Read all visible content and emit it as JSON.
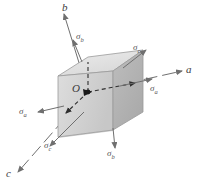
{
  "figure": {
    "type": "engineering-diagram",
    "background": "#ffffff"
  },
  "origin": {
    "label": "O"
  },
  "axes": [
    {
      "name": "a",
      "label": "a",
      "direction": "right",
      "x1": 88,
      "y1": 92,
      "x2": 186,
      "y2": 70,
      "style": "dashed"
    },
    {
      "name": "b",
      "label": "b",
      "direction": "up",
      "x1": 88,
      "y1": 92,
      "x2": 62,
      "y2": 8,
      "style": "dashed"
    },
    {
      "name": "c",
      "label": "c",
      "direction": "lower-left",
      "x1": 88,
      "y1": 92,
      "x2": 14,
      "y2": 176,
      "style": "dashed"
    }
  ],
  "stress_arrows": [
    {
      "name": "sigma-a-right",
      "symbol": "σ",
      "subscript": "a",
      "x": 155,
      "y": 88,
      "heading": "right"
    },
    {
      "name": "sigma-a-left",
      "symbol": "σ",
      "subscript": "a",
      "x": 24,
      "y": 110,
      "heading": "left"
    },
    {
      "name": "sigma-b-up",
      "symbol": "σ",
      "subscript": "b",
      "x": 80,
      "y": 36,
      "heading": "up"
    },
    {
      "name": "sigma-b-down",
      "symbol": "σ",
      "subscript": "b",
      "x": 110,
      "y": 150,
      "heading": "down"
    },
    {
      "name": "sigma-c-upper-right",
      "symbol": "σ",
      "subscript": "c",
      "x": 137,
      "y": 47,
      "heading": "upper-right"
    },
    {
      "name": "sigma-c-lower-left",
      "symbol": "σ",
      "subscript": "c",
      "x": 48,
      "y": 143,
      "heading": "lower-left"
    }
  ],
  "cube": {
    "name": "stress-element-cube",
    "face_top_fill": "#e3e3e3",
    "face_left_fill": "#d3d3d3",
    "face_front_fill": "#b6b6b6",
    "edge_color": "#8a8a8a"
  },
  "colors": {
    "line": "#6f6f6f",
    "text": "#4a4a4a",
    "dashed": "#3a3a3a"
  }
}
